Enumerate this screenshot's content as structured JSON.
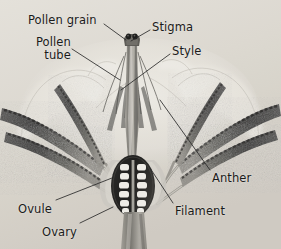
{
  "figure": {
    "type": "botanical-cross-section",
    "render": "grayscale-photograph",
    "width": 281,
    "height": 249,
    "background_color": "#d8d4cc",
    "label_color": "#1b1b1b",
    "leader_color": "#2a2a2a"
  },
  "labels": [
    {
      "id": "pollen-grain",
      "text": "Pollen grain",
      "x": 28,
      "y": 14,
      "align": "left"
    },
    {
      "id": "stigma",
      "text": "Stigma",
      "x": 152,
      "y": 21,
      "align": "left"
    },
    {
      "id": "pollen-tube",
      "text": "Pollen\ntube",
      "x": 36,
      "y": 36,
      "align": "right"
    },
    {
      "id": "style",
      "text": "Style",
      "x": 172,
      "y": 45,
      "align": "left"
    },
    {
      "id": "anther",
      "text": "Anther",
      "x": 212,
      "y": 172,
      "align": "left"
    },
    {
      "id": "filament",
      "text": "Filament",
      "x": 175,
      "y": 205,
      "align": "left"
    },
    {
      "id": "ovule",
      "text": "Ovule",
      "x": 18,
      "y": 203,
      "align": "left"
    },
    {
      "id": "ovary",
      "text": "Ovary",
      "x": 42,
      "y": 226,
      "align": "left"
    }
  ],
  "leaders": [
    {
      "id": "leader-pollen-grain",
      "from": [
        104,
        24
      ],
      "to": [
        126,
        40
      ]
    },
    {
      "id": "leader-stigma",
      "from": [
        150,
        30
      ],
      "to": [
        131,
        41
      ]
    },
    {
      "id": "leader-pollen-tube",
      "from": [
        72,
        49
      ],
      "to": [
        120,
        80
      ]
    },
    {
      "id": "leader-style",
      "from": [
        170,
        54
      ],
      "to": [
        121,
        90
      ]
    },
    {
      "id": "leader-anther",
      "from": [
        210,
        170
      ],
      "to": [
        160,
        100
      ]
    },
    {
      "id": "leader-filament",
      "from": [
        173,
        203
      ],
      "to": [
        150,
        168
      ]
    },
    {
      "id": "leader-ovule",
      "from": [
        56,
        200
      ],
      "to": [
        112,
        178
      ]
    },
    {
      "id": "leader-ovary",
      "from": [
        80,
        223
      ],
      "to": [
        113,
        207
      ]
    }
  ],
  "anatomy": {
    "parts": [
      "Pollen grain",
      "Stigma",
      "Pollen tube",
      "Style",
      "Anther",
      "Filament",
      "Ovule",
      "Ovary"
    ],
    "ovule_rows": 6,
    "ovule_columns": 2,
    "pollen_grain_count": 2,
    "anther_count": 6
  }
}
